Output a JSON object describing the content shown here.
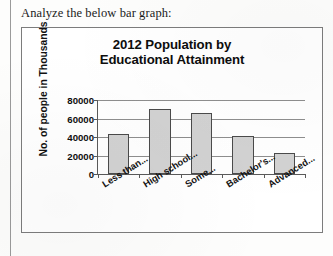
{
  "page": {
    "prompt": "Analyze the below bar graph:"
  },
  "chart_data": {
    "type": "bar",
    "title": "2012 Population by Educational Attainment",
    "title_line1": "2012 Population by",
    "title_line2": "Educational Attainment",
    "xlabel": "",
    "ylabel": "No. of people in Thousands",
    "categories": [
      "Less than...",
      "High school...",
      "Some...",
      "Bachelor's...",
      "Advanced..."
    ],
    "values": [
      43000,
      70000,
      66000,
      41000,
      23000
    ],
    "ylim": [
      0,
      80000
    ],
    "yticks": [
      0,
      20000,
      40000,
      60000,
      80000
    ],
    "ytick_labels": [
      "0",
      "20000",
      "40000",
      "60000",
      "80000"
    ],
    "grid": true,
    "legend": "none",
    "bar_color": "#d2d2d2",
    "bar_edge_color": "#4a4a4a"
  }
}
